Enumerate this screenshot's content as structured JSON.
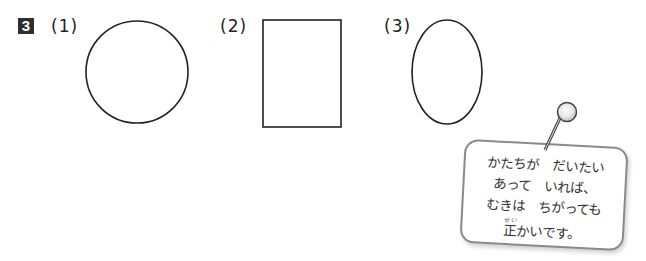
{
  "problem": {
    "number": "3",
    "items": [
      {
        "label": "(1)",
        "shape": "circle"
      },
      {
        "label": "(2)",
        "shape": "rectangle"
      },
      {
        "label": "(3)",
        "shape": "ellipse"
      }
    ]
  },
  "note": {
    "icon": "pushpin-icon",
    "lines": [
      "かたちが　だいたい",
      "あって　いれば、",
      "むきは　ちがっても"
    ],
    "last_line": {
      "kanji": "正",
      "ruby": "せい",
      "rest": "かいです。"
    }
  },
  "colors": {
    "stroke": "#222222",
    "badge": "#2e2e2e",
    "note_border": "#8a8a8a"
  }
}
